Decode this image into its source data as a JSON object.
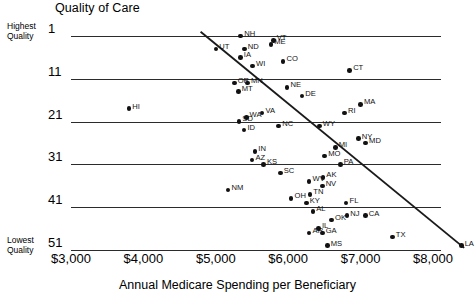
{
  "chart_data": {
    "type": "scatter",
    "title": "Quality of Care",
    "xlabel": "Annual Medicare Spending per Beneficiary",
    "ylabel": "Quality of Care",
    "y_axis_top_caption": "Highest Quality",
    "y_axis_bottom_caption": "Lowest Quality",
    "xticks": [
      "$3,000",
      "$4,000",
      "$5,000",
      "$6,000",
      "$7,000",
      "$8,000"
    ],
    "xtick_values": [
      3000,
      4000,
      5000,
      6000,
      7000,
      8000
    ],
    "yticks": [
      "1",
      "11",
      "21",
      "31",
      "41",
      "51"
    ],
    "ytick_values": [
      1,
      11,
      21,
      31,
      41,
      51
    ],
    "xlim": [
      3000,
      8000
    ],
    "ylim": [
      1,
      51
    ],
    "y_inverted": true,
    "grid": true,
    "legend": "none",
    "trendline": {
      "x0": 4790,
      "y0": 0,
      "x1": 8430,
      "y1": 50.5
    },
    "points": [
      {
        "label": "NH",
        "x": 5345,
        "y": 1
      },
      {
        "label": "VT",
        "x": 5795,
        "y": 2
      },
      {
        "label": "ME",
        "x": 5760,
        "y": 3
      },
      {
        "label": "UT",
        "x": 5000,
        "y": 4
      },
      {
        "label": "ND",
        "x": 5395,
        "y": 4
      },
      {
        "label": "IA",
        "x": 5340,
        "y": 6
      },
      {
        "label": "WI",
        "x": 5510,
        "y": 8
      },
      {
        "label": "CO",
        "x": 5930,
        "y": 7
      },
      {
        "label": "CT",
        "x": 6850,
        "y": 9
      },
      {
        "label": "OR",
        "x": 5255,
        "y": 12
      },
      {
        "label": "MN",
        "x": 5440,
        "y": 12
      },
      {
        "label": "MT",
        "x": 5310,
        "y": 14
      },
      {
        "label": "NE",
        "x": 5985,
        "y": 13
      },
      {
        "label": "DE",
        "x": 6190,
        "y": 15
      },
      {
        "label": "MA",
        "x": 7000,
        "y": 17
      },
      {
        "label": "RI",
        "x": 6780,
        "y": 19
      },
      {
        "label": "HI",
        "x": 3800,
        "y": 18
      },
      {
        "label": "VA",
        "x": 5640,
        "y": 19
      },
      {
        "label": "SD",
        "x": 5320,
        "y": 21
      },
      {
        "label": "WA",
        "x": 5420,
        "y": 20
      },
      {
        "label": "ID",
        "x": 5390,
        "y": 23
      },
      {
        "label": "NC",
        "x": 5870,
        "y": 22
      },
      {
        "label": "WY",
        "x": 6430,
        "y": 22
      },
      {
        "label": "MI",
        "x": 6650,
        "y": 27
      },
      {
        "label": "NY",
        "x": 6970,
        "y": 25
      },
      {
        "label": "MD",
        "x": 7070,
        "y": 26
      },
      {
        "label": "IN",
        "x": 5540,
        "y": 28
      },
      {
        "label": "AZ",
        "x": 5500,
        "y": 30
      },
      {
        "label": "KS",
        "x": 5660,
        "y": 31
      },
      {
        "label": "MO",
        "x": 6505,
        "y": 29
      },
      {
        "label": "PA",
        "x": 6720,
        "y": 31
      },
      {
        "label": "SC",
        "x": 5890,
        "y": 33
      },
      {
        "label": "WV",
        "x": 6290,
        "y": 35
      },
      {
        "label": "AK",
        "x": 6480,
        "y": 34
      },
      {
        "label": "NV",
        "x": 6470,
        "y": 36
      },
      {
        "label": "NM",
        "x": 5170,
        "y": 37
      },
      {
        "label": "OH",
        "x": 6040,
        "y": 39
      },
      {
        "label": "TN",
        "x": 6300,
        "y": 38
      },
      {
        "label": "KY",
        "x": 6250,
        "y": 40
      },
      {
        "label": "FL",
        "x": 6800,
        "y": 40
      },
      {
        "label": "AL",
        "x": 6340,
        "y": 42
      },
      {
        "label": "NJ",
        "x": 6810,
        "y": 43
      },
      {
        "label": "OK",
        "x": 6600,
        "y": 44
      },
      {
        "label": "CA",
        "x": 7065,
        "y": 43
      },
      {
        "label": "IL",
        "x": 6420,
        "y": 46
      },
      {
        "label": "GA",
        "x": 6470,
        "y": 47
      },
      {
        "label": "AR",
        "x": 6290,
        "y": 47
      },
      {
        "label": "MS",
        "x": 6540,
        "y": 50
      },
      {
        "label": "TX",
        "x": 7440,
        "y": 48
      },
      {
        "label": "LA",
        "x": 8390,
        "y": 50
      }
    ]
  }
}
